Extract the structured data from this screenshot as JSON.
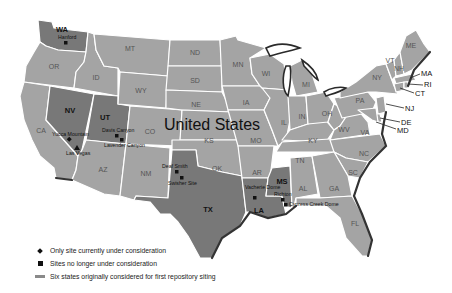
{
  "map": {
    "title": "United States",
    "states": [
      {
        "abbr": "WA",
        "selected": true
      },
      {
        "abbr": "OR",
        "selected": false
      },
      {
        "abbr": "CA",
        "selected": false
      },
      {
        "abbr": "ID",
        "selected": false
      },
      {
        "abbr": "NV",
        "selected": true
      },
      {
        "abbr": "UT",
        "selected": true
      },
      {
        "abbr": "AZ",
        "selected": false
      },
      {
        "abbr": "MT",
        "selected": false
      },
      {
        "abbr": "WY",
        "selected": false
      },
      {
        "abbr": "CO",
        "selected": false
      },
      {
        "abbr": "NM",
        "selected": false
      },
      {
        "abbr": "ND",
        "selected": false
      },
      {
        "abbr": "SD",
        "selected": false
      },
      {
        "abbr": "NE",
        "selected": false
      },
      {
        "abbr": "KS",
        "selected": false
      },
      {
        "abbr": "OK",
        "selected": false
      },
      {
        "abbr": "TX",
        "selected": true
      },
      {
        "abbr": "MN",
        "selected": false
      },
      {
        "abbr": "IA",
        "selected": false
      },
      {
        "abbr": "MO",
        "selected": false
      },
      {
        "abbr": "AR",
        "selected": false
      },
      {
        "abbr": "LA",
        "selected": true
      },
      {
        "abbr": "WI",
        "selected": false
      },
      {
        "abbr": "IL",
        "selected": false
      },
      {
        "abbr": "MS",
        "selected": true
      },
      {
        "abbr": "MI",
        "selected": false
      },
      {
        "abbr": "IN",
        "selected": false
      },
      {
        "abbr": "KY",
        "selected": false
      },
      {
        "abbr": "TN",
        "selected": false
      },
      {
        "abbr": "AL",
        "selected": false
      },
      {
        "abbr": "OH",
        "selected": false
      },
      {
        "abbr": "WV",
        "selected": false
      },
      {
        "abbr": "VA",
        "selected": false
      },
      {
        "abbr": "NC",
        "selected": false
      },
      {
        "abbr": "SC",
        "selected": false
      },
      {
        "abbr": "GA",
        "selected": false
      },
      {
        "abbr": "FL",
        "selected": false
      },
      {
        "abbr": "PA",
        "selected": false
      },
      {
        "abbr": "NY",
        "selected": false
      },
      {
        "abbr": "VT",
        "selected": false
      },
      {
        "abbr": "NH",
        "selected": false
      },
      {
        "abbr": "ME",
        "selected": false
      },
      {
        "abbr": "MA",
        "selected": false
      },
      {
        "abbr": "RI",
        "selected": false
      },
      {
        "abbr": "CT",
        "selected": false
      },
      {
        "abbr": "NJ",
        "selected": false
      },
      {
        "abbr": "DE",
        "selected": false
      },
      {
        "abbr": "MD",
        "selected": false
      }
    ],
    "callouts": [
      "MA",
      "RI",
      "CT",
      "NJ",
      "DE",
      "MD"
    ],
    "sites": [
      {
        "name": "Hanford",
        "state": "WA",
        "symbol": "square"
      },
      {
        "name": "Yucca Mountain",
        "state": "NV",
        "symbol": "diamond"
      },
      {
        "name": "Las Vegas",
        "state": "NV",
        "symbol": "triangle"
      },
      {
        "name": "Davis Canyon",
        "state": "UT",
        "symbol": "square"
      },
      {
        "name": "Lavender Canyon",
        "state": "UT",
        "symbol": "square"
      },
      {
        "name": "Deaf Smith",
        "state": "TX",
        "symbol": "square"
      },
      {
        "name": "Swisher Site",
        "state": "TX",
        "symbol": "square"
      },
      {
        "name": "Vacherie Dome",
        "state": "LA",
        "symbol": "square"
      },
      {
        "name": "Richton",
        "state": "MS",
        "symbol": "square"
      },
      {
        "name": "Cypress Creek Dome",
        "state": "MS",
        "symbol": "square"
      }
    ],
    "colors": {
      "state_fill": "#a4a4a4",
      "selected_fill": "#787878",
      "border": "#ffffff",
      "coast": "#333333"
    }
  },
  "legend": {
    "items": [
      {
        "symbol": "diamond",
        "label": "Only site currently under consideration"
      },
      {
        "symbol": "square",
        "label": "Sites no longer under consideration"
      },
      {
        "symbol": "swatch",
        "label": "Six states originally considered for first repository siting"
      }
    ]
  }
}
